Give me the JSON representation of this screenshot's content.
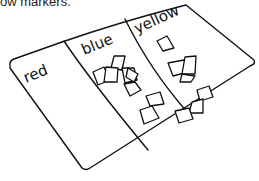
{
  "caption": "ow markers.",
  "mat": {
    "columns": [
      {
        "label": "red",
        "paper_count": 0
      },
      {
        "label": "blue",
        "paper_count": 8
      },
      {
        "label": "yellow",
        "paper_count": 7
      }
    ]
  },
  "colors": {
    "stroke": "#111111",
    "background": "#ffffff"
  }
}
